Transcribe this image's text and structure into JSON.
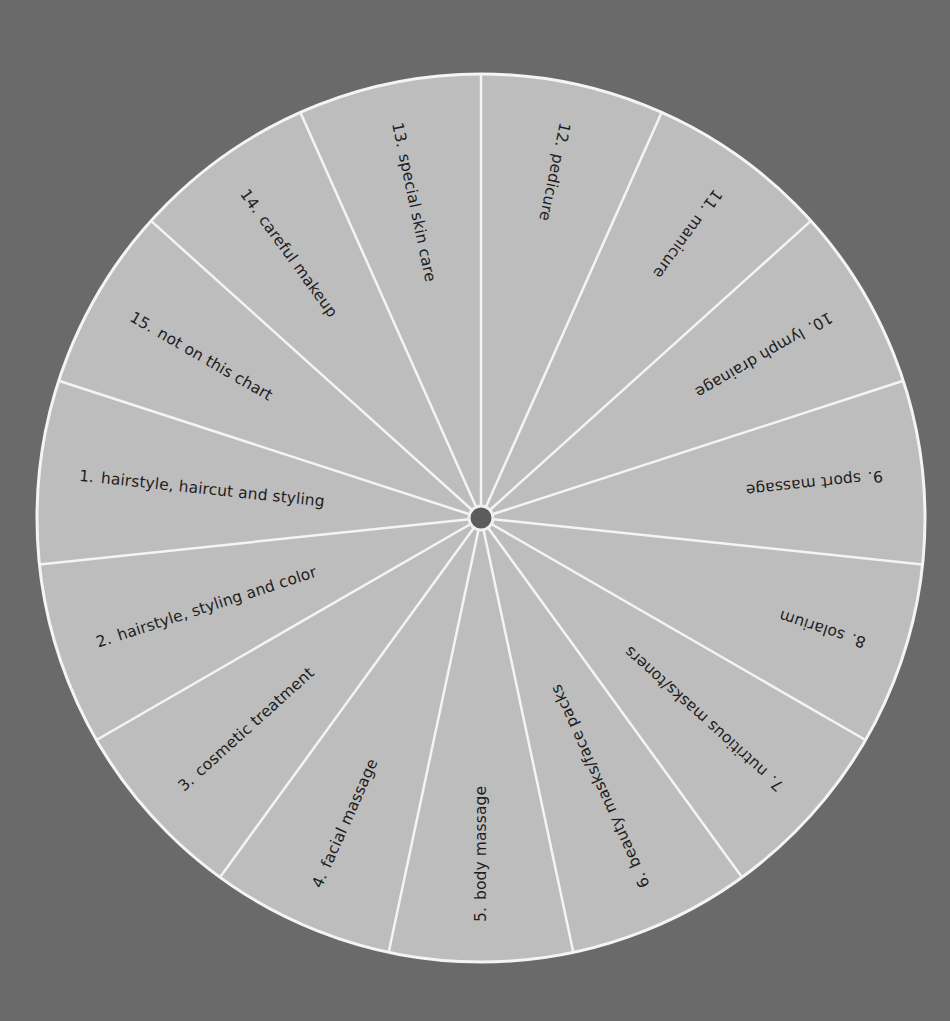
{
  "wheel": {
    "center": [
      481,
      518
    ],
    "radius": 444,
    "hub_radius": 12,
    "sector_count": 15,
    "first_spoke_angle_deg": 0,
    "colors": {
      "background": "#6a6a6a",
      "sector": "#bdbdbd",
      "divider": "#f4f4f4",
      "hub": "#5c5c5c",
      "text": "#1e1e1e"
    },
    "sectors_clockwise_from_top": [
      {
        "number": "12.",
        "label": "pedicure"
      },
      {
        "number": "11.",
        "label": "manicure"
      },
      {
        "number": "10.",
        "label": "lymph drainage"
      },
      {
        "number": "9.",
        "label": "sport massage"
      },
      {
        "number": "8.",
        "label": "solarium"
      },
      {
        "number": "7.",
        "label": "nutritious masks/toners"
      },
      {
        "number": "6.",
        "label": "beauty masks/face packs"
      },
      {
        "number": "5.",
        "label": "body massage"
      },
      {
        "number": "4.",
        "label": "facial massage"
      },
      {
        "number": "3.",
        "label": "cosmetic treatment"
      },
      {
        "number": "2.",
        "label": "hairstyle, styling and color"
      },
      {
        "number": "1.",
        "label": "hairstyle, haircut and styling"
      },
      {
        "number": "15.",
        "label": "not on this chart"
      },
      {
        "number": "14.",
        "label": "careful makeup"
      },
      {
        "number": "13.",
        "label": "special skin care"
      }
    ]
  }
}
